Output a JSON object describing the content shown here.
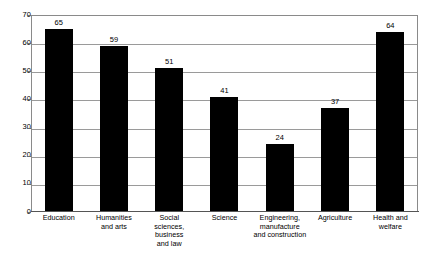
{
  "chart_data": {
    "type": "bar",
    "title": "",
    "subtitle": "",
    "xlabel": "",
    "ylabel": "",
    "ylim": [
      0,
      70
    ],
    "ytick_step": 10,
    "yticks": [
      70,
      60,
      50,
      40,
      30,
      20,
      10,
      0
    ],
    "grid": true,
    "legend": null,
    "bar_color": "#000000",
    "gridline_color": "#9a9a9a",
    "frame_color": "#8a8a8a",
    "background": "#ffffff",
    "categories": [
      "Education",
      "Humanities\nand arts",
      "Social\nsciences,\nbusiness\nand law",
      "Science",
      "Engineering,\nmanufacture\nand construction",
      "Agriculture",
      "Health and\nwelfare"
    ],
    "values": [
      65,
      59,
      51,
      41,
      24,
      37,
      64
    ],
    "value_labels": [
      "65",
      "59",
      "51",
      "41",
      "24",
      "37",
      "64"
    ]
  }
}
